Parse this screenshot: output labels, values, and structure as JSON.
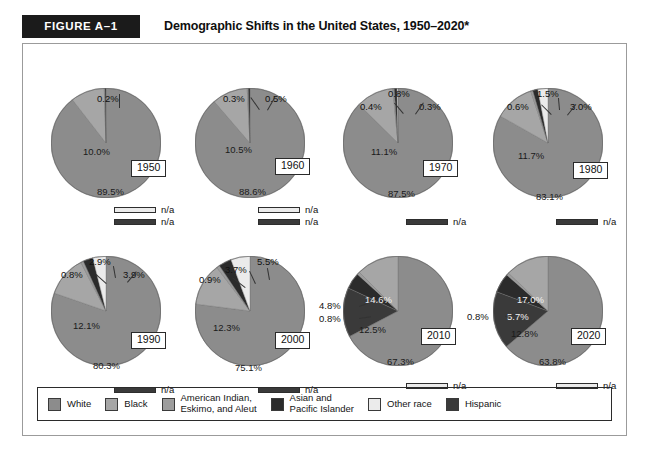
{
  "header": {
    "figure_badge": "FIGURE A–1",
    "title": "Demographic Shifts in the United States, 1950–2020*"
  },
  "colors": {
    "white_race": "#8c8c8c",
    "black_race": "#a6a6a6",
    "american_indian": "#9d9d9d",
    "asian_pacific": "#2b2b2b",
    "other_race": "#ebebeb",
    "hispanic": "#3a3a3a",
    "frame_border": "#9b9b9b",
    "badge_bg": "#1b1b1b",
    "badge_text": "#ffffff"
  },
  "legend": {
    "items": [
      {
        "label": "White",
        "color_key": "white_race",
        "swatch": "#8c8c8c"
      },
      {
        "label": "Black",
        "color_key": "black_race",
        "swatch": "#a6a6a6"
      },
      {
        "label": "American Indian,\nEskimo, and Aleut",
        "color_key": "american_indian",
        "swatch": "#9d9d9d"
      },
      {
        "label": "Asian and\nPacific Islander",
        "color_key": "asian_pacific",
        "swatch": "#2b2b2b"
      },
      {
        "label": "Other race",
        "color_key": "other_race",
        "swatch": "#ebebeb"
      },
      {
        "label": "Hispanic",
        "color_key": "hispanic",
        "swatch": "#3a3a3a"
      }
    ]
  },
  "na_text": "n/a",
  "chart_data": {
    "type": "pie",
    "title": "Demographic Shifts in the United States, 1950–2020*",
    "note": "Eight pie charts, one per census decade. Values are percent of total U.S. population by race/ethnicity.",
    "legend_position": "bottom",
    "categories": [
      "White",
      "Black",
      "American Indian, Eskimo, and Aleut",
      "Asian and Pacific Islander",
      "Other race",
      "Hispanic"
    ],
    "charts": [
      {
        "year": "1950",
        "slices": [
          {
            "label": "White",
            "value": 89.5,
            "text": "89.5%"
          },
          {
            "label": "Black",
            "value": 10.0,
            "text": "10.0%"
          },
          {
            "label": "American Indian, Eskimo, and Aleut",
            "value": 0.2,
            "text": "0.2%"
          },
          {
            "label": "Asian and Pacific Islander",
            "value": 0.3,
            "text": ""
          },
          {
            "label": "Other race",
            "value": 0,
            "text": "n/a"
          },
          {
            "label": "Hispanic",
            "value": 0,
            "text": "n/a"
          }
        ],
        "na_entries": [
          "Other race",
          "Hispanic"
        ]
      },
      {
        "year": "1960",
        "slices": [
          {
            "label": "White",
            "value": 88.6,
            "text": "88.6%"
          },
          {
            "label": "Black",
            "value": 10.5,
            "text": "10.5%"
          },
          {
            "label": "American Indian, Eskimo, and Aleut",
            "value": 0.3,
            "text": "0.3%"
          },
          {
            "label": "Asian and Pacific Islander",
            "value": 0.5,
            "text": "0.5%"
          },
          {
            "label": "Other race",
            "value": 0,
            "text": "n/a"
          },
          {
            "label": "Hispanic",
            "value": 0,
            "text": "n/a"
          }
        ],
        "na_entries": [
          "Other race",
          "Hispanic"
        ]
      },
      {
        "year": "1970",
        "slices": [
          {
            "label": "White",
            "value": 87.5,
            "text": "87.5%"
          },
          {
            "label": "Black",
            "value": 11.1,
            "text": "11.1%"
          },
          {
            "label": "American Indian, Eskimo, and Aleut",
            "value": 0.4,
            "text": "0.4%"
          },
          {
            "label": "Asian and Pacific Islander",
            "value": 0.8,
            "text": "0.8%"
          },
          {
            "label": "Other race",
            "value": 0.3,
            "text": "0.3%"
          },
          {
            "label": "Hispanic",
            "value": 0,
            "text": "n/a"
          }
        ],
        "na_entries": [
          "Hispanic"
        ]
      },
      {
        "year": "1980",
        "slices": [
          {
            "label": "White",
            "value": 83.1,
            "text": "83.1%"
          },
          {
            "label": "Black",
            "value": 11.7,
            "text": "11.7%"
          },
          {
            "label": "American Indian, Eskimo, and Aleut",
            "value": 0.6,
            "text": "0.6%"
          },
          {
            "label": "Asian and Pacific Islander",
            "value": 1.5,
            "text": "1.5%"
          },
          {
            "label": "Other race",
            "value": 3.0,
            "text": "3.0%"
          },
          {
            "label": "Hispanic",
            "value": 0,
            "text": "n/a"
          }
        ],
        "na_entries": [
          "Hispanic"
        ]
      },
      {
        "year": "1990",
        "slices": [
          {
            "label": "White",
            "value": 80.3,
            "text": "80.3%"
          },
          {
            "label": "Black",
            "value": 12.1,
            "text": "12.1%"
          },
          {
            "label": "American Indian, Eskimo, and Aleut",
            "value": 0.8,
            "text": "0.8%"
          },
          {
            "label": "Asian and Pacific Islander",
            "value": 2.9,
            "text": "2.9%"
          },
          {
            "label": "Other race",
            "value": 3.9,
            "text": "3.9%"
          },
          {
            "label": "Hispanic",
            "value": 0,
            "text": "n/a"
          }
        ],
        "na_entries": [
          "Hispanic"
        ]
      },
      {
        "year": "2000",
        "slices": [
          {
            "label": "White",
            "value": 75.1,
            "text": "75.1%"
          },
          {
            "label": "Black",
            "value": 12.3,
            "text": "12.3%"
          },
          {
            "label": "American Indian, Eskimo, and Aleut",
            "value": 0.9,
            "text": "0.9%"
          },
          {
            "label": "Asian and Pacific Islander",
            "value": 3.7,
            "text": "3.7%"
          },
          {
            "label": "Other race",
            "value": 5.5,
            "text": "5.5%"
          },
          {
            "label": "Hispanic",
            "value": 0,
            "text": "n/a"
          }
        ],
        "na_entries": [
          "Hispanic"
        ]
      },
      {
        "year": "2010",
        "slices": [
          {
            "label": "White",
            "value": 67.3,
            "text": "67.3%"
          },
          {
            "label": "Black",
            "value": 12.5,
            "text": "12.5%"
          },
          {
            "label": "American Indian, Eskimo, and Aleut",
            "value": 0.8,
            "text": "0.8%"
          },
          {
            "label": "Asian and Pacific Islander",
            "value": 4.8,
            "text": "4.8%"
          },
          {
            "label": "Other race",
            "value": 0,
            "text": "n/a"
          },
          {
            "label": "Hispanic",
            "value": 14.6,
            "text": "14.6%"
          }
        ],
        "na_entries": [
          "Other race"
        ]
      },
      {
        "year": "2020",
        "slices": [
          {
            "label": "White",
            "value": 63.8,
            "text": "63.8%"
          },
          {
            "label": "Black",
            "value": 12.8,
            "text": "12.8%"
          },
          {
            "label": "American Indian, Eskimo, and Aleut",
            "value": 0.8,
            "text": "0.8%"
          },
          {
            "label": "Asian and Pacific Islander",
            "value": 5.7,
            "text": "5.7%"
          },
          {
            "label": "Other race",
            "value": 0,
            "text": "n/a"
          },
          {
            "label": "Hispanic",
            "value": 17.0,
            "text": "17.0%"
          }
        ],
        "na_entries": [
          "Other race"
        ]
      }
    ]
  }
}
